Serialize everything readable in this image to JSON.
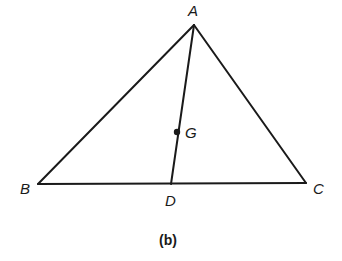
{
  "figure": {
    "caption": "(b)",
    "vertices": {
      "A": {
        "label": "A",
        "x": 194,
        "y": 25
      },
      "B": {
        "label": "B",
        "x": 38,
        "y": 184
      },
      "C": {
        "label": "C",
        "x": 306,
        "y": 183
      }
    },
    "points": {
      "D": {
        "label": "D",
        "x": 171,
        "y": 184
      },
      "G": {
        "label": "G",
        "x": 177,
        "y": 132
      }
    },
    "segments": [
      {
        "from": "A",
        "to": "B"
      },
      {
        "from": "A",
        "to": "C"
      },
      {
        "from": "B",
        "to": "C"
      },
      {
        "from": "A",
        "to": "D"
      }
    ],
    "stroke_color": "#1a1a1a"
  }
}
